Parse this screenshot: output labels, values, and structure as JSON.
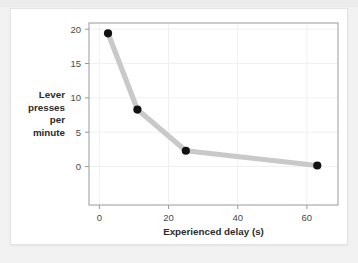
{
  "chart_data": {
    "type": "line",
    "title": "",
    "xlabel": "Experienced delay (s)",
    "ylabel": "Lever presses per minute",
    "ylabel_lines": [
      "Lever",
      "presses",
      "per",
      "minute"
    ],
    "x": [
      2.5,
      11,
      25,
      63
    ],
    "values": [
      19.4,
      8.3,
      2.3,
      0.15
    ],
    "series": [
      {
        "name": "Lever presses per minute",
        "x": [
          2.5,
          11,
          25,
          63
        ],
        "values": [
          19.4,
          8.3,
          2.3,
          0.15
        ]
      }
    ],
    "xlim": [
      -3,
      69
    ],
    "ylim": [
      -5.6,
      20.9
    ],
    "xticks": [
      0,
      20,
      40,
      60
    ],
    "xtick_labels": [
      "0",
      "20",
      "40",
      "60"
    ],
    "yticks": [
      0,
      5,
      10,
      15,
      20
    ],
    "ytick_labels": [
      "0",
      "5",
      "10",
      "15",
      "20"
    ],
    "grid": true,
    "legend": "none",
    "line_color": "#c9c9c9",
    "marker_color": "#121212",
    "frame_color": "#9a9a9a",
    "grid_color": "#eef0f2",
    "background_color": "#ffffff",
    "page_background_color": "#f2f2f2"
  }
}
